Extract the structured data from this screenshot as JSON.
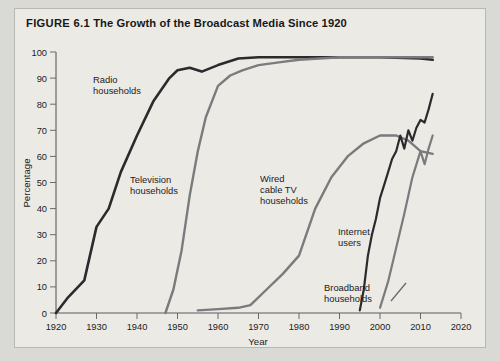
{
  "figure": {
    "number": "FIGURE 6.1",
    "title": "The Growth of the Broadcast Media Since 1920",
    "background_color": "#d9d9d6",
    "panel_color": "#eceae5"
  },
  "chart_data": {
    "type": "line",
    "title": "The Growth of the Broadcast Media Since 1920",
    "xlabel": "Year",
    "ylabel": "Percentage",
    "xlim": [
      1920,
      2020
    ],
    "ylim": [
      0,
      100
    ],
    "xticks": [
      1920,
      1930,
      1940,
      1950,
      1960,
      1970,
      1980,
      1990,
      2000,
      2010,
      2020
    ],
    "yticks": [
      0,
      10,
      20,
      30,
      40,
      50,
      60,
      70,
      80,
      90,
      100
    ],
    "xtick_labels": [
      "1920",
      "1930",
      "1940",
      "1950",
      "1960",
      "1970",
      "1980",
      "1990",
      "2000",
      "2010",
      "2020"
    ],
    "ytick_labels": [
      "0",
      "10",
      "20",
      "30",
      "40",
      "50",
      "60",
      "70",
      "80",
      "90",
      "100"
    ],
    "grid": false,
    "legend": "none (inline annotations)",
    "series": [
      {
        "name": "Radio households",
        "color": "#2b2b2d",
        "label_position": "upper-left",
        "x": [
          1920,
          1923,
          1927,
          1930,
          1933,
          1936,
          1940,
          1944,
          1948,
          1950,
          1953,
          1956,
          1960,
          1965,
          1970,
          1980,
          1990,
          2000,
          2010,
          2013
        ],
        "values": [
          0,
          6,
          12.5,
          33,
          40,
          54,
          68,
          81,
          90,
          93,
          94,
          92.5,
          95,
          97.5,
          98,
          98,
          98,
          98,
          97.5,
          97
        ]
      },
      {
        "name": "Television households",
        "color": "#7b7b7d",
        "label_position": "left-middle",
        "x": [
          1947,
          1949,
          1951,
          1953,
          1955,
          1957,
          1960,
          1963,
          1966,
          1970,
          1975,
          1980,
          1990,
          2000,
          2010,
          2013
        ],
        "values": [
          0,
          9,
          24,
          45,
          62,
          75,
          87,
          91,
          93,
          95,
          96,
          97,
          98,
          98,
          98,
          98
        ]
      },
      {
        "name": "Wired cable TV households",
        "color": "#7b7b7d",
        "label_position": "center",
        "x": [
          1955,
          1960,
          1965,
          1968,
          1972,
          1976,
          1980,
          1984,
          1988,
          1992,
          1996,
          2000,
          2004,
          2007,
          2010,
          2013
        ],
        "values": [
          1,
          1.5,
          2,
          3,
          9,
          15,
          22,
          40,
          52,
          60,
          65,
          68,
          68,
          66,
          62,
          61
        ]
      },
      {
        "name": "Internet users",
        "color": "#2b2b2d",
        "label_position": "lower-right",
        "x": [
          1995,
          1996,
          1997,
          1998,
          1999,
          2000,
          2001,
          2002,
          2003,
          2004,
          2005,
          2006,
          2007,
          2008,
          2009,
          2010,
          2011,
          2012,
          2013
        ],
        "values": [
          1,
          9,
          22,
          30,
          36,
          44,
          49,
          54,
          59,
          62,
          68,
          63,
          70,
          66,
          71,
          74,
          73,
          78,
          84
        ]
      },
      {
        "name": "Broadband households",
        "color": "#7b7b7d",
        "label_position": "bottom-right",
        "x": [
          2000,
          2002,
          2004,
          2006,
          2008,
          2010,
          2011,
          2012,
          2013
        ],
        "values": [
          2,
          12,
          25,
          38,
          52,
          62,
          57,
          63,
          68
        ]
      }
    ],
    "annotations": [
      {
        "text": "Radio households",
        "lines": [
          "Radio",
          "households"
        ]
      },
      {
        "text": "Television households",
        "lines": [
          "Television",
          "households"
        ]
      },
      {
        "text": "Wired cable TV households",
        "lines": [
          "Wired",
          "cable TV",
          "households"
        ]
      },
      {
        "text": "Internet users",
        "lines": [
          "Internet",
          "users"
        ]
      },
      {
        "text": "Broadband households",
        "lines": [
          "Broadband",
          "households"
        ],
        "has_leader_line": true
      }
    ]
  }
}
